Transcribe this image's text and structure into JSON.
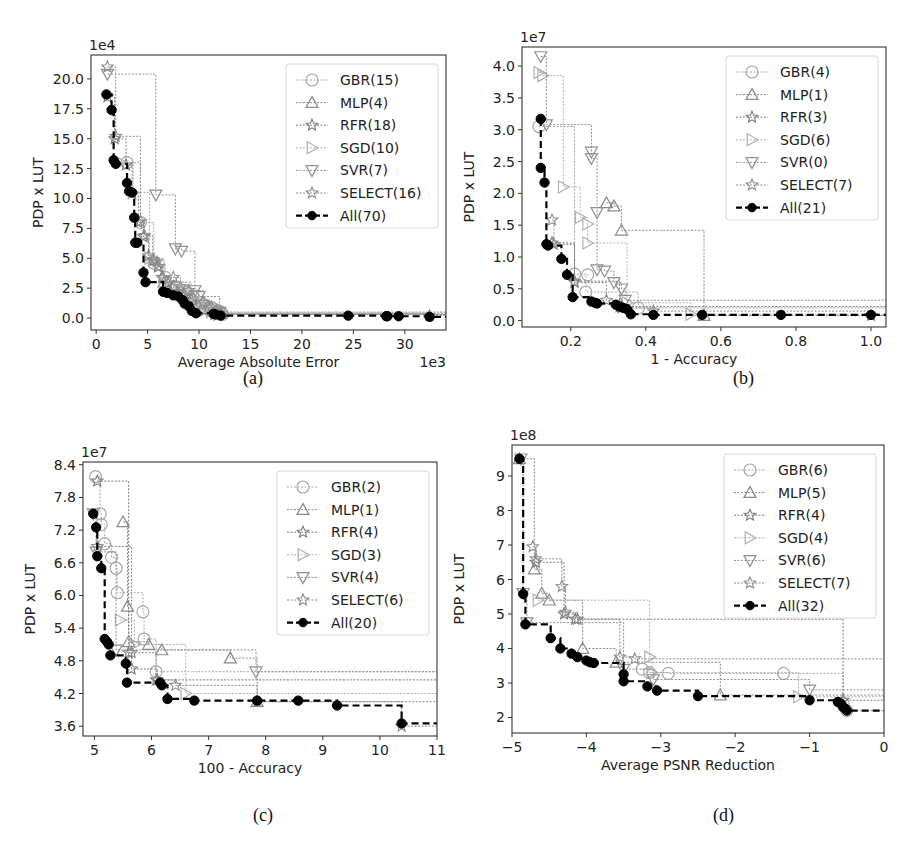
{
  "figure": {
    "captions": [
      "(a)",
      "(b)",
      "(c)",
      "(d)"
    ]
  },
  "legend_markers": {
    "GBR": "circle-open",
    "MLP": "triangle-up-open",
    "RFR": "star-open",
    "SGD": "triangle-right-open",
    "SVR": "triangle-down-open",
    "SELECT": "star-open",
    "All": "circle-filled"
  },
  "colors": {
    "GBR": "#a8a8a8",
    "MLP": "#8a8a8a",
    "RFR": "#7a7a7a",
    "SGD": "#b0b0b0",
    "SVR": "#909090",
    "SELECT": "#8c8c8c",
    "All": "#000000",
    "axis": "#333333"
  },
  "chart_data": [
    {
      "id": "a",
      "type": "line",
      "subtype": "step-pareto-front",
      "caption": "(a)",
      "title": "",
      "xlabel": "Average Absolute Error",
      "ylabel": "PDP x LUT",
      "x_multiplier_label": "1e3",
      "y_multiplier_label": "1e4",
      "xlim": [
        -0.5,
        34
      ],
      "ylim": [
        -1.0,
        22.0
      ],
      "xticks": [
        0,
        5,
        10,
        15,
        20,
        25,
        30
      ],
      "xtick_labels": [
        "0",
        "5",
        "10",
        "15",
        "20",
        "25",
        "30"
      ],
      "yticks": [
        0.0,
        2.5,
        5.0,
        7.5,
        10.0,
        12.5,
        15.0,
        17.5,
        20.0
      ],
      "ytick_labels": [
        "0.0",
        "2.5",
        "5.0",
        "7.5",
        "10.0",
        "12.5",
        "15.0",
        "17.5",
        "20.0"
      ],
      "grid": false,
      "legend_position": "upper right",
      "series": [
        {
          "name": "GBR(15)",
          "key": "GBR",
          "x": [
            3.0,
            4.3,
            5.6,
            6.7,
            7.8,
            8.6,
            9.4,
            10.2,
            10.8,
            11.2,
            11.6,
            11.9,
            12.1,
            12.2,
            12.3
          ],
          "y": [
            13.0,
            8.0,
            4.6,
            3.4,
            2.6,
            2.3,
            1.8,
            1.3,
            1.0,
            0.9,
            0.7,
            0.6,
            0.5,
            0.4,
            0.3
          ]
        },
        {
          "name": "MLP(4)",
          "key": "MLP",
          "x": [
            6.6,
            9.2,
            11.0,
            12.1
          ],
          "y": [
            3.0,
            1.5,
            0.8,
            0.4
          ]
        },
        {
          "name": "RFR(18)",
          "key": "RFR",
          "x": [
            1.1,
            1.8,
            2.9,
            3.5,
            4.1,
            4.6,
            5.1,
            5.6,
            6.0,
            6.4,
            7.0,
            7.5,
            8.0,
            8.6,
            9.1,
            9.7,
            10.5,
            11.5
          ],
          "y": [
            18.5,
            15.0,
            12.8,
            10.4,
            8.0,
            6.8,
            5.2,
            4.8,
            4.3,
            3.4,
            2.9,
            2.6,
            2.2,
            1.9,
            1.4,
            1.0,
            0.6,
            0.3
          ]
        },
        {
          "name": "SGD(10)",
          "key": "SGD",
          "x": [
            2.4,
            3.6,
            5.2,
            6.6,
            8.0,
            9.2,
            10.0,
            10.6,
            11.2,
            11.9
          ],
          "y": [
            13.0,
            10.5,
            5.0,
            3.0,
            2.4,
            1.8,
            1.2,
            0.8,
            0.5,
            0.3
          ]
        },
        {
          "name": "SVR(7)",
          "key": "SVR",
          "x": [
            1.1,
            5.8,
            7.7,
            8.3,
            9.6,
            10.0,
            12.0
          ],
          "y": [
            20.4,
            10.3,
            5.8,
            5.6,
            2.3,
            1.8,
            0.5
          ]
        },
        {
          "name": "SELECT(16)",
          "key": "SELECT",
          "x": [
            1.1,
            1.9,
            4.3,
            4.7,
            5.5,
            5.9,
            6.1,
            6.5,
            7.5,
            8.2,
            9.0,
            10.4,
            11.2,
            11.7,
            12.0,
            32.4
          ],
          "y": [
            21.0,
            15.2,
            8.1,
            6.9,
            4.9,
            4.7,
            4.3,
            3.4,
            3.4,
            2.6,
            2.3,
            1.3,
            0.9,
            0.6,
            0.4,
            0.2
          ]
        },
        {
          "name": "All(70)",
          "key": "All",
          "x": [
            1.0,
            1.5,
            1.7,
            1.9,
            3.0,
            3.2,
            3.5,
            3.7,
            3.8,
            4.0,
            4.6,
            4.8,
            6.5,
            6.9,
            7.5,
            8.0,
            8.4,
            8.6,
            9.0,
            9.3,
            9.7,
            11.4,
            11.6,
            12.1,
            24.5,
            28.2,
            28.3,
            29.4,
            32.4
          ],
          "y": [
            18.7,
            17.4,
            13.2,
            12.9,
            11.3,
            10.6,
            10.5,
            8.4,
            6.3,
            6.3,
            3.8,
            3.0,
            2.2,
            2.1,
            1.9,
            1.8,
            1.5,
            1.2,
            1.0,
            0.6,
            0.4,
            0.35,
            0.3,
            0.2,
            0.2,
            0.15,
            0.15,
            0.15,
            0.1
          ]
        }
      ]
    },
    {
      "id": "b",
      "type": "line",
      "subtype": "step-pareto-front",
      "caption": "(b)",
      "title": "",
      "xlabel": "1 - Accuracy",
      "ylabel": "PDP x LUT",
      "x_multiplier_label": "",
      "y_multiplier_label": "1e7",
      "xlim": [
        0.07,
        1.04
      ],
      "ylim": [
        -0.1,
        4.3
      ],
      "xticks": [
        0.2,
        0.4,
        0.6,
        0.8,
        1.0
      ],
      "xtick_labels": [
        "0.2",
        "0.4",
        "0.6",
        "0.8",
        "1.0"
      ],
      "yticks": [
        0.0,
        0.5,
        1.0,
        1.5,
        2.0,
        2.5,
        3.0,
        3.5,
        4.0
      ],
      "ytick_labels": [
        "0.0",
        "0.5",
        "1.0",
        "1.5",
        "2.0",
        "2.5",
        "3.0",
        "3.5",
        "4.0"
      ],
      "grid": false,
      "legend_position": "upper right",
      "series": [
        {
          "name": "GBR(4)",
          "key": "GBR",
          "x": [
            0.115,
            0.21,
            0.245,
            0.24,
            0.38
          ],
          "y": [
            3.05,
            0.73,
            0.72,
            0.45,
            0.2
          ]
        },
        {
          "name": "MLP(1)",
          "key": "MLP",
          "x": [
            0.295,
            0.315,
            0.335,
            0.555
          ],
          "y": [
            1.85,
            1.8,
            1.42,
            0.08
          ]
        },
        {
          "name": "RFR(3)",
          "key": "RFR",
          "x": [
            0.15,
            0.21,
            0.33
          ],
          "y": [
            1.22,
            0.62,
            0.22
          ]
        },
        {
          "name": "SGD(6)",
          "key": "SGD",
          "x": [
            0.115,
            0.125,
            0.18,
            0.225,
            0.245,
            0.245,
            0.35,
            0.52
          ],
          "y": [
            3.9,
            3.85,
            2.1,
            1.62,
            1.52,
            1.22,
            0.28,
            0.1
          ]
        },
        {
          "name": "SVR(0)",
          "key": "SVR",
          "x": [
            0.12,
            0.135,
            0.255,
            0.255,
            0.27,
            0.27,
            0.29,
            0.315,
            0.335,
            0.345
          ],
          "y": [
            4.15,
            3.08,
            2.65,
            2.55,
            1.7,
            0.8,
            0.78,
            0.6,
            0.5,
            0.32
          ]
        },
        {
          "name": "SELECT(7)",
          "key": "SELECT",
          "x": [
            0.15,
            0.155,
            0.21,
            0.295,
            0.335,
            0.42,
            1.0
          ],
          "y": [
            1.58,
            1.2,
            0.6,
            0.32,
            0.2,
            0.15,
            0.08
          ]
        },
        {
          "name": "All(21)",
          "key": "All",
          "x": [
            0.12,
            0.12,
            0.13,
            0.135,
            0.14,
            0.175,
            0.19,
            0.205,
            0.255,
            0.265,
            0.27,
            0.32,
            0.33,
            0.34,
            0.35,
            0.36,
            0.42,
            0.55,
            0.76,
            1.0
          ],
          "y": [
            3.17,
            2.4,
            2.17,
            1.2,
            1.18,
            0.97,
            0.72,
            0.37,
            0.3,
            0.28,
            0.27,
            0.25,
            0.22,
            0.2,
            0.18,
            0.1,
            0.09,
            0.09,
            0.09,
            0.09
          ]
        }
      ]
    },
    {
      "id": "c",
      "type": "line",
      "subtype": "step-pareto-front",
      "caption": "(c)",
      "title": "",
      "xlabel": "100 - Accuracy",
      "ylabel": "PDP x LUT",
      "x_multiplier_label": "",
      "y_multiplier_label": "1e7",
      "xlim": [
        4.8,
        11.0
      ],
      "ylim": [
        3.42,
        8.45
      ],
      "xticks": [
        5,
        6,
        7,
        8,
        9,
        10,
        11
      ],
      "xtick_labels": [
        "5",
        "6",
        "7",
        "8",
        "9",
        "10",
        "11"
      ],
      "yticks": [
        3.6,
        4.2,
        4.8,
        5.4,
        6.0,
        6.6,
        7.2,
        7.8,
        8.4
      ],
      "ytick_labels": [
        "3.6",
        "4.2",
        "4.8",
        "5.4",
        "6.0",
        "6.6",
        "7.2",
        "7.8",
        "8.4"
      ],
      "grid": false,
      "legend_position": "upper right",
      "series": [
        {
          "name": "GBR(2)",
          "key": "GBR",
          "x": [
            5.02,
            5.1,
            5.12,
            5.18,
            5.3,
            5.38,
            5.4,
            5.85,
            5.87,
            6.08
          ],
          "y": [
            8.18,
            7.5,
            7.3,
            6.95,
            6.7,
            6.5,
            6.05,
            5.7,
            5.2,
            4.6
          ]
        },
        {
          "name": "MLP(1)",
          "key": "MLP",
          "x": [
            5.5,
            5.58,
            5.6,
            5.95,
            6.18,
            7.38,
            7.85
          ],
          "y": [
            7.35,
            5.8,
            5.15,
            5.1,
            5.0,
            4.85,
            4.05
          ]
        },
        {
          "name": "RFR(4)",
          "key": "RFR",
          "x": [
            5.05,
            5.6,
            5.65,
            6.1
          ],
          "y": [
            8.1,
            4.95,
            4.65,
            4.45
          ]
        },
        {
          "name": "SGD(3)",
          "key": "SGD",
          "x": [
            5.45,
            5.7,
            6.6
          ],
          "y": [
            5.55,
            5.1,
            4.2
          ]
        },
        {
          "name": "SVR(4)",
          "key": "SVR",
          "x": [
            4.98,
            5.03,
            5.38,
            7.83
          ],
          "y": [
            7.5,
            6.8,
            5.0,
            4.6
          ]
        },
        {
          "name": "SELECT(6)",
          "key": "SELECT",
          "x": [
            5.05,
            5.65,
            6.08,
            6.42,
            7.85,
            10.38
          ],
          "y": [
            6.9,
            4.95,
            4.45,
            4.35,
            4.05,
            3.6
          ]
        },
        {
          "name": "All(20)",
          "key": "All",
          "x": [
            4.98,
            5.03,
            5.05,
            5.12,
            5.18,
            5.22,
            5.25,
            5.28,
            5.55,
            5.57,
            6.15,
            6.18,
            6.28,
            6.75,
            7.85,
            8.57,
            9.25,
            10.38
          ],
          "y": [
            7.5,
            7.25,
            6.72,
            6.5,
            5.2,
            5.15,
            5.1,
            4.9,
            4.75,
            4.4,
            4.4,
            4.35,
            4.1,
            4.07,
            4.07,
            4.07,
            3.98,
            3.65
          ]
        }
      ]
    },
    {
      "id": "d",
      "type": "line",
      "subtype": "step-pareto-front",
      "caption": "(d)",
      "title": "",
      "xlabel": "Average PSNR Reduction",
      "ylabel": "PDP x LUT",
      "x_multiplier_label": "",
      "y_multiplier_label": "1e8",
      "xlim": [
        -5.0,
        0.0
      ],
      "ylim": [
        1.55,
        9.9
      ],
      "xticks": [
        -5,
        -4,
        -3,
        -2,
        -1,
        0
      ],
      "xtick_labels": [
        "−5",
        "−4",
        "−3",
        "−2",
        "−1",
        "0"
      ],
      "yticks": [
        2,
        3,
        4,
        5,
        6,
        7,
        8,
        9
      ],
      "ytick_labels": [
        "2",
        "3",
        "4",
        "5",
        "6",
        "7",
        "8",
        "9"
      ],
      "grid": false,
      "legend_position": "upper right",
      "series": [
        {
          "name": "GBR(6)",
          "key": "GBR",
          "x": [
            -3.25,
            -3.15,
            -2.9,
            -1.35,
            -0.55,
            -0.5
          ],
          "y": [
            3.4,
            3.3,
            3.28,
            3.28,
            2.4,
            2.2
          ]
        },
        {
          "name": "MLP(5)",
          "key": "MLP",
          "x": [
            -4.9,
            -4.7,
            -4.6,
            -4.5,
            -4.05,
            -3.6,
            -2.2
          ],
          "y": [
            9.5,
            6.3,
            5.6,
            5.4,
            4.0,
            3.6,
            2.65
          ]
        },
        {
          "name": "RFR(4)",
          "key": "RFR",
          "x": [
            -4.68,
            -4.3,
            -4.15,
            -0.55
          ],
          "y": [
            6.5,
            5.0,
            4.85,
            2.5
          ]
        },
        {
          "name": "SGD(4)",
          "key": "SGD",
          "x": [
            -4.65,
            -3.15,
            -3.12,
            -1.15
          ],
          "y": [
            5.4,
            3.75,
            3.3,
            2.6
          ]
        },
        {
          "name": "SVR(6)",
          "key": "SVR",
          "x": [
            -4.88,
            -4.85,
            -4.8,
            -3.5,
            -3.1,
            -1.0
          ],
          "y": [
            9.5,
            5.6,
            4.75,
            3.4,
            3.1,
            2.8
          ]
        },
        {
          "name": "SELECT(7)",
          "key": "SELECT",
          "x": [
            -4.72,
            -4.68,
            -4.33,
            -4.28,
            -4.12,
            -3.55,
            -3.35
          ],
          "y": [
            6.95,
            6.6,
            5.8,
            5.05,
            4.85,
            3.75,
            3.7
          ]
        },
        {
          "name": "All(32)",
          "key": "All",
          "x": [
            -4.9,
            -4.85,
            -4.82,
            -4.48,
            -4.35,
            -4.2,
            -4.12,
            -4.0,
            -3.95,
            -3.9,
            -3.5,
            -3.5,
            -3.18,
            -3.05,
            -2.5,
            -1.0,
            -0.62,
            -0.58,
            -0.55,
            -0.52,
            -0.5
          ],
          "y": [
            9.5,
            5.58,
            4.7,
            4.3,
            4.0,
            3.85,
            3.75,
            3.65,
            3.6,
            3.58,
            3.25,
            3.05,
            2.9,
            2.78,
            2.62,
            2.5,
            2.45,
            2.4,
            2.3,
            2.25,
            2.2
          ]
        }
      ]
    }
  ]
}
